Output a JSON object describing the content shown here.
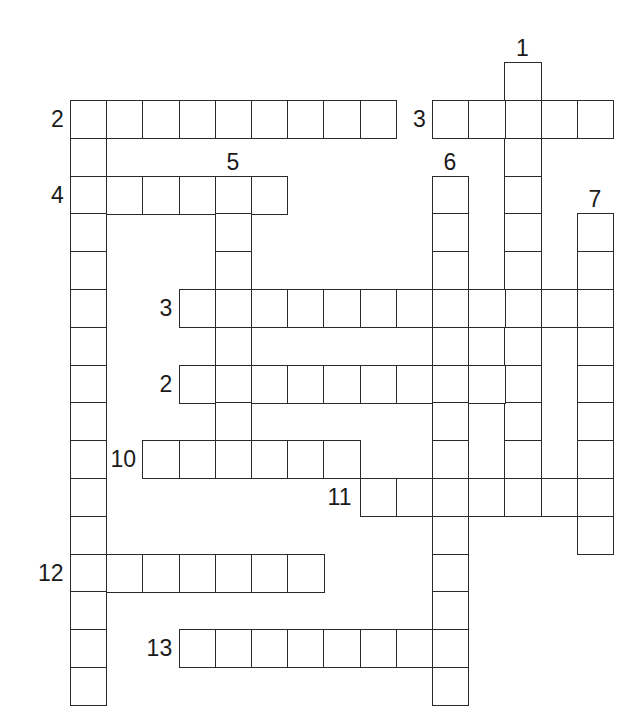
{
  "puzzle": {
    "type": "crossword",
    "entries": [
      {
        "label": "1",
        "direction": "down",
        "row": -1,
        "col": 12,
        "length": 11
      },
      {
        "label": "2",
        "direction": "across",
        "row": 0,
        "col": 0,
        "length": 9
      },
      {
        "label": "2",
        "direction": "down",
        "row": 0,
        "col": 0,
        "length": 16,
        "unlabeled": true
      },
      {
        "label": "3",
        "direction": "across",
        "row": 0,
        "col": 10,
        "length": 5
      },
      {
        "label": "4",
        "direction": "across",
        "row": 2,
        "col": 0,
        "length": 6
      },
      {
        "label": "5",
        "direction": "down",
        "row": 2,
        "col": 4,
        "length": 8
      },
      {
        "label": "6",
        "direction": "down",
        "row": 2,
        "col": 10,
        "length": 14
      },
      {
        "label": "7",
        "direction": "down",
        "row": 3,
        "col": 14,
        "length": 9
      },
      {
        "label": "3",
        "direction": "across",
        "row": 5,
        "col": 3,
        "length": 12
      },
      {
        "label": "2",
        "direction": "across",
        "row": 7,
        "col": 3,
        "length": 10
      },
      {
        "label": "10",
        "direction": "across",
        "row": 9,
        "col": 2,
        "length": 6
      },
      {
        "label": "11",
        "direction": "across",
        "row": 10,
        "col": 8,
        "length": 7
      },
      {
        "label": "12",
        "direction": "across",
        "row": 12,
        "col": 0,
        "length": 7
      },
      {
        "label": "13",
        "direction": "across",
        "row": 14,
        "col": 3,
        "length": 8
      }
    ]
  }
}
